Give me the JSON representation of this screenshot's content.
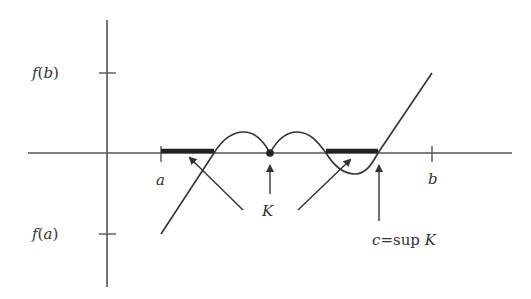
{
  "diagram": {
    "colors": {
      "axis": "#555555",
      "curve": "#333333",
      "bar": "#222222",
      "text": "#333333",
      "background": "#ffffff"
    },
    "y_axis_labels": {
      "f_b": "f(b)",
      "f_a": "f(a)"
    },
    "x_axis_labels": {
      "a": "a",
      "b": "b"
    },
    "set_label": "K",
    "sup_label": "c=sup K",
    "sup_label_parts": {
      "c": "c",
      "eq": "=sup ",
      "K": "K"
    }
  }
}
